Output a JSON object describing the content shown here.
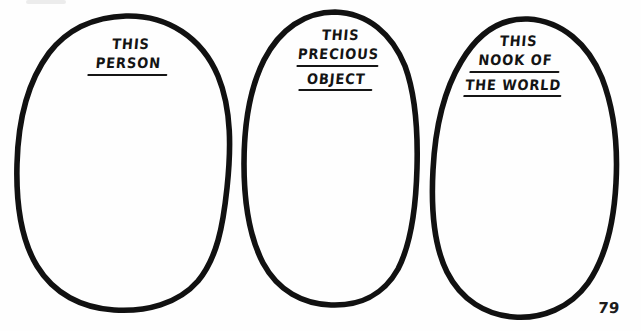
{
  "page": {
    "background_color": "#fefefe",
    "ink_color": "#111111",
    "page_number": "79",
    "width": 641,
    "height": 331
  },
  "ovals": [
    {
      "id": "oval-1",
      "name": "this-person",
      "lines": [
        {
          "text": "THIS",
          "underlined": false
        },
        {
          "text": "PERSON",
          "underlined": true
        }
      ]
    },
    {
      "id": "oval-2",
      "name": "this-precious-object",
      "lines": [
        {
          "text": "THIS",
          "underlined": false
        },
        {
          "text": "PRECIOUS",
          "underlined": true
        },
        {
          "text": "OBJECT",
          "underlined": true
        }
      ]
    },
    {
      "id": "oval-3",
      "name": "this-nook-of-the-world",
      "lines": [
        {
          "text": "THIS",
          "underlined": false
        },
        {
          "text": "NOOK OF",
          "underlined": true
        },
        {
          "text": "THE WORLD",
          "underlined": true
        }
      ]
    }
  ]
}
